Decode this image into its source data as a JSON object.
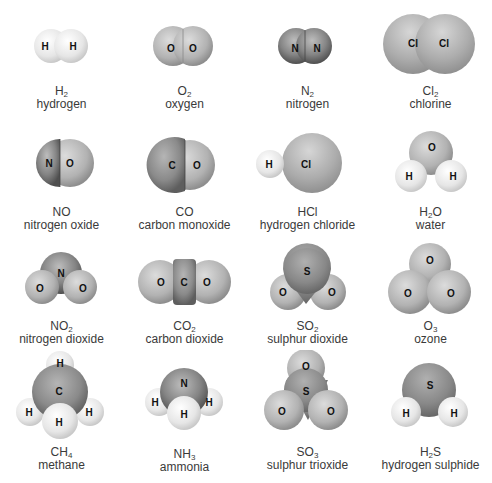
{
  "colors": {
    "H": "#ececec",
    "O": "#b8b8b8",
    "N": "#7f7f7f",
    "C": "#8a8a8a",
    "Cl": "#a9a9a9",
    "S": "#8c8c8c",
    "text": "#3a3a3a",
    "background": "#ffffff"
  },
  "molecules": [
    {
      "formula_main": "H",
      "formula_sub": "2",
      "formula_tail": "",
      "name": "hydrogen",
      "atoms": [
        "H",
        "H"
      ]
    },
    {
      "formula_main": "O",
      "formula_sub": "2",
      "formula_tail": "",
      "name": "oxygen",
      "atoms": [
        "O",
        "O"
      ]
    },
    {
      "formula_main": "N",
      "formula_sub": "2",
      "formula_tail": "",
      "name": "nitrogen",
      "atoms": [
        "N",
        "N"
      ]
    },
    {
      "formula_main": "Cl",
      "formula_sub": "2",
      "formula_tail": "",
      "name": "chlorine",
      "atoms": [
        "Cl",
        "Cl"
      ]
    },
    {
      "formula_main": "NO",
      "formula_sub": "",
      "formula_tail": "",
      "name": "nitrogen oxide",
      "atoms": [
        "N",
        "O"
      ]
    },
    {
      "formula_main": "CO",
      "formula_sub": "",
      "formula_tail": "",
      "name": "carbon monoxide",
      "atoms": [
        "C",
        "O"
      ]
    },
    {
      "formula_main": "HCl",
      "formula_sub": "",
      "formula_tail": "",
      "name": "hydrogen chloride",
      "atoms": [
        "H",
        "Cl"
      ]
    },
    {
      "formula_main": "H",
      "formula_sub": "2",
      "formula_tail": "O",
      "name": "water",
      "atoms": [
        "O",
        "H",
        "H"
      ]
    },
    {
      "formula_main": "NO",
      "formula_sub": "2",
      "formula_tail": "",
      "name": "nitrogen dioxide",
      "atoms": [
        "N",
        "O",
        "O"
      ]
    },
    {
      "formula_main": "CO",
      "formula_sub": "2",
      "formula_tail": "",
      "name": "carbon dioxide",
      "atoms": [
        "O",
        "C",
        "O"
      ]
    },
    {
      "formula_main": "SO",
      "formula_sub": "2",
      "formula_tail": "",
      "name": "sulphur dioxide",
      "atoms": [
        "S",
        "O",
        "O"
      ]
    },
    {
      "formula_main": "O",
      "formula_sub": "3",
      "formula_tail": "",
      "name": "ozone",
      "atoms": [
        "O",
        "O",
        "O"
      ]
    },
    {
      "formula_main": "CH",
      "formula_sub": "4",
      "formula_tail": "",
      "name": "methane",
      "atoms": [
        "H",
        "C",
        "H",
        "H",
        "H"
      ]
    },
    {
      "formula_main": "NH",
      "formula_sub": "3",
      "formula_tail": "",
      "name": "ammonia",
      "atoms": [
        "N",
        "H",
        "H",
        "H"
      ]
    },
    {
      "formula_main": "SO",
      "formula_sub": "3",
      "formula_tail": "",
      "name": "sulphur trioxide",
      "atoms": [
        "O",
        "S",
        "O",
        "O"
      ]
    },
    {
      "formula_main": "H",
      "formula_sub": "2",
      "formula_tail": "S",
      "name": "hydrogen sulphide",
      "atoms": [
        "S",
        "H",
        "H"
      ]
    }
  ]
}
